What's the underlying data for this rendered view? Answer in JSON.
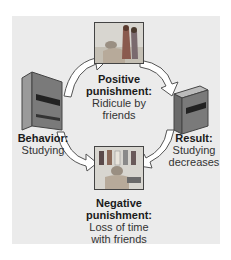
{
  "diagram": {
    "behavior": {
      "heading": "Behavior:",
      "line1": "Studying"
    },
    "positive": {
      "heading1": "Positive",
      "heading2": "punishment:",
      "line1": "Ridicule by",
      "line2": "friends"
    },
    "negative": {
      "heading1": "Negative",
      "heading2": "punishment:",
      "line1": "Loss of time",
      "line2": "with friends"
    },
    "result": {
      "heading": "Result:",
      "line1": "Studying",
      "line2": "decreases"
    }
  },
  "colors": {
    "panel": "#ebebeb",
    "arrow_fill": "#ffffff",
    "arrow_stroke": "#555555",
    "book_cover": "#6e6e6e",
    "book_band": "#222222"
  }
}
